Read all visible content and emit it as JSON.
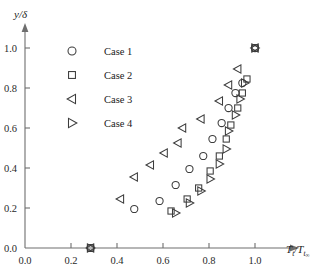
{
  "chart_data": {
    "type": "scatter",
    "title": "",
    "xlabel": "T_t/T_t∞",
    "ylabel": "y/δ",
    "xlabel_parts": {
      "main": "T",
      "sub": "t",
      "denom": "T",
      "denom_sub": "t",
      "denom_subsub": "∞"
    },
    "ylabel_parts": {
      "num": "y",
      "den": "δ"
    },
    "xlim": [
      0.0,
      1.1
    ],
    "ylim": [
      0.0,
      1.08
    ],
    "xticks": [
      0.0,
      0.2,
      0.4,
      0.6,
      0.8,
      1.0
    ],
    "xtick_labels": [
      "0.0",
      "0.2",
      "0.4",
      "0.6",
      "0.8",
      "1.0"
    ],
    "yticks": [
      0.0,
      0.2,
      0.4,
      0.6,
      0.8,
      1.0
    ],
    "ytick_labels": [
      "0.0",
      "0.2",
      "0.4",
      "0.6",
      "0.8",
      "1.0"
    ],
    "grid": false,
    "legend_position": "upper-left",
    "marker_color": "#3c3c3c",
    "axis_color": "#6e6e6e",
    "series": [
      {
        "name": "Case 1",
        "marker": "circle",
        "points": [
          [
            0.285,
            0.0
          ],
          [
            0.475,
            0.195
          ],
          [
            0.585,
            0.235
          ],
          [
            0.655,
            0.315
          ],
          [
            0.715,
            0.395
          ],
          [
            0.775,
            0.46
          ],
          [
            0.815,
            0.545
          ],
          [
            0.855,
            0.625
          ],
          [
            0.885,
            0.7
          ],
          [
            0.915,
            0.775
          ],
          [
            0.945,
            0.825
          ],
          [
            1.0,
            1.0
          ]
        ]
      },
      {
        "name": "Case 2",
        "marker": "square",
        "points": [
          [
            0.285,
            0.0
          ],
          [
            0.635,
            0.185
          ],
          [
            0.705,
            0.245
          ],
          [
            0.755,
            0.3
          ],
          [
            0.805,
            0.385
          ],
          [
            0.845,
            0.46
          ],
          [
            0.875,
            0.545
          ],
          [
            0.895,
            0.615
          ],
          [
            0.925,
            0.7
          ],
          [
            0.945,
            0.775
          ],
          [
            0.965,
            0.845
          ],
          [
            1.0,
            1.0
          ]
        ]
      },
      {
        "name": "Case 3",
        "marker": "triangle-left",
        "points": [
          [
            0.285,
            0.0
          ],
          [
            0.415,
            0.245
          ],
          [
            0.475,
            0.355
          ],
          [
            0.545,
            0.415
          ],
          [
            0.605,
            0.475
          ],
          [
            0.665,
            0.525
          ],
          [
            0.685,
            0.6
          ],
          [
            0.765,
            0.645
          ],
          [
            0.845,
            0.735
          ],
          [
            0.885,
            0.815
          ],
          [
            0.925,
            0.895
          ],
          [
            1.0,
            1.0
          ]
        ]
      },
      {
        "name": "Case 4",
        "marker": "triangle-right",
        "points": [
          [
            0.285,
            0.0
          ],
          [
            0.655,
            0.175
          ],
          [
            0.715,
            0.225
          ],
          [
            0.765,
            0.285
          ],
          [
            0.805,
            0.345
          ],
          [
            0.845,
            0.42
          ],
          [
            0.875,
            0.495
          ],
          [
            0.885,
            0.585
          ],
          [
            0.915,
            0.665
          ],
          [
            0.935,
            0.745
          ],
          [
            0.955,
            0.825
          ],
          [
            1.0,
            1.0
          ]
        ]
      }
    ]
  },
  "legend": {
    "items": [
      {
        "label": "Case 1",
        "marker": "circle"
      },
      {
        "label": "Case 2",
        "marker": "square"
      },
      {
        "label": "Case 3",
        "marker": "triangle-left"
      },
      {
        "label": "Case 4",
        "marker": "triangle-right"
      }
    ]
  }
}
